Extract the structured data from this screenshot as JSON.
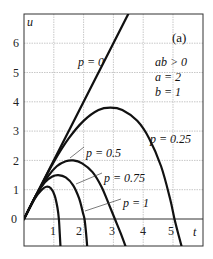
{
  "chart_data": {
    "type": "line",
    "title": "",
    "panel_label": "(a)",
    "xlabel": "t",
    "ylabel": "u",
    "xlim": [
      0,
      6
    ],
    "ylim": [
      -1.05,
      7.0
    ],
    "xticks": [
      1,
      2,
      3,
      4,
      5
    ],
    "yticks": [
      0,
      1,
      2,
      3,
      4,
      5,
      6
    ],
    "grid": true,
    "legend_position": "none",
    "annotations": [
      "ab > 0",
      "a = 2",
      "b = 1"
    ],
    "series": [
      {
        "name": "p = 0",
        "label": "p = 0",
        "points": [
          [
            0,
            0
          ],
          [
            3.5,
            7.0
          ]
        ]
      },
      {
        "name": "p = 0.25",
        "label": "p = 0.25",
        "points": [
          [
            0,
            0
          ],
          [
            0.5,
            1.0
          ],
          [
            1.0,
            1.95
          ],
          [
            1.5,
            2.75
          ],
          [
            2.0,
            3.35
          ],
          [
            2.5,
            3.72
          ],
          [
            2.9,
            3.8
          ],
          [
            3.3,
            3.72
          ],
          [
            3.8,
            3.35
          ],
          [
            4.2,
            2.75
          ],
          [
            4.6,
            1.8
          ],
          [
            4.9,
            0.7
          ],
          [
            5.05,
            0.0
          ],
          [
            5.2,
            -0.6
          ],
          [
            5.32,
            -1.05
          ]
        ]
      },
      {
        "name": "p = 0.5",
        "label": "p = 0.5",
        "points": [
          [
            0,
            0
          ],
          [
            0.4,
            0.8
          ],
          [
            0.8,
            1.45
          ],
          [
            1.1,
            1.8
          ],
          [
            1.4,
            1.97
          ],
          [
            1.65,
            2.0
          ],
          [
            1.95,
            1.9
          ],
          [
            2.3,
            1.6
          ],
          [
            2.6,
            1.1
          ],
          [
            2.85,
            0.5
          ],
          [
            3.05,
            0.0
          ],
          [
            3.25,
            -0.5
          ],
          [
            3.45,
            -1.05
          ]
        ]
      },
      {
        "name": "p = 0.75",
        "label": "p = 0.75",
        "points": [
          [
            0,
            0
          ],
          [
            0.4,
            0.8
          ],
          [
            0.7,
            1.25
          ],
          [
            0.95,
            1.45
          ],
          [
            1.15,
            1.5
          ],
          [
            1.4,
            1.42
          ],
          [
            1.65,
            1.15
          ],
          [
            1.85,
            0.7
          ],
          [
            1.98,
            0.2
          ],
          [
            2.03,
            0.0
          ],
          [
            2.08,
            -0.45
          ],
          [
            2.13,
            -1.05
          ]
        ]
      },
      {
        "name": "p = 1",
        "label": "p = 1",
        "points": [
          [
            0,
            0
          ],
          [
            0.35,
            0.68
          ],
          [
            0.6,
            1.0
          ],
          [
            0.75,
            1.1
          ],
          [
            0.9,
            1.05
          ],
          [
            1.03,
            0.8
          ],
          [
            1.12,
            0.4
          ],
          [
            1.17,
            0.0
          ],
          [
            1.2,
            -0.5
          ],
          [
            1.23,
            -1.05
          ]
        ]
      }
    ],
    "label_positions": {
      "p = 0": {
        "x": 78,
        "y": 49
      },
      "p = 0.25": {
        "x": 152,
        "y": 144
      },
      "p = 0.5": {
        "x": 85,
        "y": 150
      },
      "p = 0.75": {
        "x": 103,
        "y": 176
      },
      "p = 1": {
        "x": 122,
        "y": 202
      }
    },
    "leaders": [
      {
        "series": "p = 0.5",
        "from": [
          84,
          147
        ],
        "to": [
          70,
          158
        ]
      },
      {
        "series": "p = 0.75",
        "from": [
          102,
          173
        ],
        "to": [
          76,
          184
        ]
      },
      {
        "series": "p = 1",
        "from": [
          121,
          199
        ],
        "to": [
          85,
          211
        ]
      }
    ]
  },
  "text": {
    "panel_label": "(a)",
    "xlabel": "t",
    "ylabel": "u",
    "cond1": "ab > 0",
    "cond2": "a = 2",
    "cond3": "b = 1",
    "p0": "p = 0",
    "p025": "p = 0.25",
    "p05": "p = 0.5",
    "p075": "p = 0.75",
    "p1": "p = 1",
    "yt0": "0",
    "yt1": "1",
    "yt2": "2",
    "yt3": "3",
    "yt4": "4",
    "yt5": "5",
    "yt6": "6",
    "xt1": "1",
    "xt2": "2",
    "xt3": "3",
    "xt4": "4",
    "xt5": "5"
  },
  "colors": {
    "curve": "#111111",
    "frame": "#333333",
    "grid": "#b0b0b0",
    "text": "#222222"
  }
}
